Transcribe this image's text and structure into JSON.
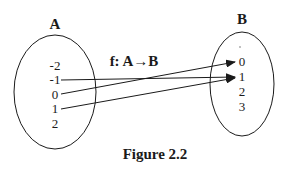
{
  "diagram": {
    "type": "function-mapping",
    "function_label": "f: A→B",
    "caption": "Figure 2.2",
    "set_a": {
      "label": "A",
      "elements": [
        "-2",
        "-1",
        "0",
        "1",
        "2"
      ]
    },
    "set_b": {
      "label": "B",
      "elements": [
        "0",
        "1",
        "2",
        "3"
      ]
    },
    "mappings": [
      {
        "from": "-1",
        "to": "1"
      },
      {
        "from": "0",
        "to": "0"
      },
      {
        "from": "1",
        "to": "1"
      }
    ],
    "colors": {
      "ink": "#1a1a1a",
      "background": "#ffffff"
    }
  }
}
